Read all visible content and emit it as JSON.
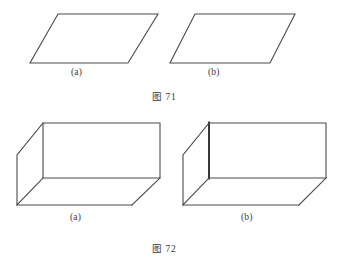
{
  "page": {
    "background_color": "#ffffff",
    "stroke_color": "#4a4a4a",
    "stroke_color_emphasis": "#2e2e2e"
  },
  "figures": [
    {
      "id": "fig-71",
      "caption": "图 71",
      "kind": "parallelograms",
      "panels": [
        {
          "id": "fig-71-a",
          "label": "(a)",
          "shape": "parallelogram",
          "vertices": [
            [
              58,
              14
            ],
            [
              158,
              14
            ],
            [
              128,
              63
            ],
            [
              30,
              63
            ]
          ]
        },
        {
          "id": "fig-71-b",
          "label": "(b)",
          "shape": "parallelogram",
          "vertices": [
            [
              195,
              14
            ],
            [
              295,
              14
            ],
            [
              270,
              63
            ],
            [
              170,
              63
            ]
          ]
        }
      ]
    },
    {
      "id": "fig-72",
      "caption": "图 72",
      "kind": "cuboids",
      "panels": [
        {
          "id": "fig-72-a",
          "label": "(a)",
          "shape": "cuboid",
          "emphasis_edge": false,
          "vertices": {
            "back_top_left": [
              43,
              123
            ],
            "back_top_right": [
              160,
              123
            ],
            "back_bottom_right": [
              160,
              178
            ],
            "back_bottom_left": [
              43,
              178
            ],
            "front_top_left": [
              17,
              155
            ],
            "front_bottom_left": [
              17,
              205
            ],
            "front_bottom_right": [
              132,
              205
            ]
          }
        },
        {
          "id": "fig-72-b",
          "label": "(b)",
          "shape": "cuboid",
          "emphasis_edge": true,
          "vertices": {
            "back_top_left": [
              209,
              123
            ],
            "back_top_right": [
              326,
              123
            ],
            "back_bottom_right": [
              326,
              178
            ],
            "back_bottom_left": [
              209,
              178
            ],
            "front_top_left": [
              183,
              155
            ],
            "front_bottom_left": [
              183,
              205
            ],
            "front_bottom_right": [
              299,
              205
            ]
          }
        }
      ]
    }
  ]
}
